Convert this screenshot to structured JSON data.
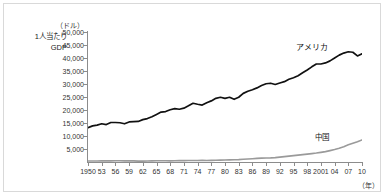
{
  "figure": {
    "unit_label": "（ドル）",
    "y_axis_title_line1": "1人当たり",
    "y_axis_title_line2": "GDP",
    "x_unit_label": "（年）",
    "border_color": "#d9d9d9",
    "axis_color": "#8c8c8c",
    "us_color": "#111111",
    "cn_color": "#9a9a9a"
  },
  "chart_data": {
    "type": "line",
    "title": "",
    "subtitle": "",
    "xlabel": "（年）",
    "ylabel": "1人当たりGDP（ドル）",
    "xlim": [
      1950,
      2010
    ],
    "ylim": [
      0,
      50000
    ],
    "grid": false,
    "legend_position": "inline-annotation",
    "y_ticks": [
      50000,
      45000,
      40000,
      35000,
      30000,
      25000,
      20000,
      15000,
      10000,
      5000
    ],
    "y_tick_labels": [
      "50,000",
      "45,000",
      "40,000",
      "35,000",
      "30,000",
      "25,000",
      "20,000",
      "15,000",
      "10,000",
      "5,000"
    ],
    "x_ticks": [
      1950,
      1953,
      1956,
      1959,
      1962,
      1965,
      1968,
      1971,
      1974,
      1977,
      1980,
      1983,
      1986,
      1989,
      1992,
      1995,
      1998,
      2001,
      2004,
      2007,
      2010
    ],
    "x_tick_labels": [
      "1950",
      "53",
      "56",
      "59",
      "62",
      "65",
      "68",
      "71",
      "74",
      "77",
      "80",
      "83",
      "86",
      "89",
      "92",
      "95",
      "98",
      "2001",
      "04",
      "07",
      "10"
    ],
    "x": [
      1950,
      1951,
      1952,
      1953,
      1954,
      1955,
      1956,
      1957,
      1958,
      1959,
      1960,
      1961,
      1962,
      1963,
      1964,
      1965,
      1966,
      1967,
      1968,
      1969,
      1970,
      1971,
      1972,
      1973,
      1974,
      1975,
      1976,
      1977,
      1978,
      1979,
      1980,
      1981,
      1982,
      1983,
      1984,
      1985,
      1986,
      1987,
      1988,
      1989,
      1990,
      1991,
      1992,
      1993,
      1994,
      1995,
      1996,
      1997,
      1998,
      1999,
      2000,
      2001,
      2002,
      2003,
      2004,
      2005,
      2006,
      2007,
      2008,
      2009,
      2010
    ],
    "series": [
      {
        "name": "アメリカ",
        "name_en": "United States",
        "color": "#111111",
        "values": [
          13200,
          13900,
          14200,
          14700,
          14400,
          15200,
          15200,
          15100,
          14700,
          15400,
          15500,
          15600,
          16300,
          16700,
          17400,
          18300,
          19200,
          19400,
          20100,
          20500,
          20300,
          20700,
          21600,
          22600,
          22200,
          21900,
          22800,
          23500,
          24500,
          24900,
          24500,
          24900,
          24100,
          24900,
          26400,
          27200,
          27800,
          28500,
          29400,
          30100,
          30300,
          29800,
          30400,
          30900,
          31800,
          32400,
          33200,
          34300,
          35400,
          36600,
          37700,
          37700,
          38100,
          38900,
          40000,
          41100,
          41900,
          42400,
          42200,
          40800,
          41600
        ]
      },
      {
        "name": "中国",
        "name_en": "China",
        "color": "#9a9a9a",
        "values": [
          360,
          370,
          400,
          420,
          430,
          450,
          470,
          480,
          450,
          470,
          430,
          340,
          350,
          380,
          420,
          460,
          490,
          460,
          440,
          480,
          520,
          540,
          550,
          580,
          580,
          610,
          590,
          620,
          670,
          720,
          770,
          800,
          860,
          930,
          1050,
          1170,
          1260,
          1380,
          1500,
          1540,
          1570,
          1680,
          1860,
          2050,
          2260,
          2450,
          2650,
          2850,
          3020,
          3210,
          3430,
          3700,
          4000,
          4380,
          4800,
          5300,
          5900,
          6600,
          7200,
          7800,
          8500
        ]
      }
    ],
    "annotations": [
      {
        "text": "アメリカ",
        "series": "アメリカ",
        "x": 2002
      },
      {
        "text": "中国",
        "series": "中国",
        "x": 2006
      }
    ]
  }
}
